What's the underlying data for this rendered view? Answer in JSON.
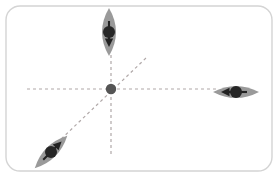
{
  "figure": {
    "canvas": {
      "width": 278,
      "height": 177,
      "background_color": "#ffffff",
      "border_color": "#d4d4d4",
      "border_radius": 14,
      "border_width": 1.4,
      "frame_inset": 6
    },
    "center_point": {
      "label": "origin",
      "x": 111,
      "y": 89,
      "radius": 5.2,
      "color": "#555555"
    },
    "axes": [
      {
        "name": "horizontal-axis",
        "orientation": "horizontal",
        "angle_deg": 0,
        "x1": 27,
        "y1": 89,
        "x2": 216,
        "y2": 89,
        "color": "#b0a8a8",
        "dash": "3 3",
        "width": 1.2
      },
      {
        "name": "vertical-axis",
        "orientation": "vertical",
        "angle_deg": 90,
        "x1": 111,
        "y1": 55,
        "x2": 111,
        "y2": 156,
        "color": "#b0a8a8",
        "dash": "3 3",
        "width": 1.2
      },
      {
        "name": "diagonal-axis",
        "orientation": "diagonal",
        "angle_deg": 45,
        "x1": 57,
        "y1": 143,
        "x2": 146,
        "y2": 58,
        "color": "#b0a8a8",
        "dash": "3 3",
        "width": 1.2
      }
    ],
    "markers": [
      {
        "name": "top-marker",
        "position_label": "top",
        "axis": "vertical-axis",
        "cx": 109,
        "cy": 32,
        "rx": 14,
        "ry": 24,
        "rotation_deg": 0,
        "fill": "#9a9a9a",
        "dot_color": "#262626",
        "dot_radius": 6,
        "arrow_direction": "down",
        "arrow_angle_deg": 90,
        "arrow_color": "#222222",
        "arrow_length": 22
      },
      {
        "name": "right-marker",
        "position_label": "right",
        "axis": "horizontal-axis",
        "cx": 236,
        "cy": 92,
        "rx": 23,
        "ry": 12,
        "rotation_deg": 0,
        "fill": "#9a9a9a",
        "dot_color": "#262626",
        "dot_radius": 6,
        "arrow_direction": "left",
        "arrow_angle_deg": 180,
        "arrow_color": "#222222",
        "arrow_length": 22
      },
      {
        "name": "bottom-left-marker",
        "position_label": "bottom-left",
        "axis": "diagonal-axis",
        "cx": 51,
        "cy": 152,
        "rx": 23,
        "ry": 12,
        "rotation_deg": -45,
        "fill": "#9a9a9a",
        "dot_color": "#262626",
        "dot_radius": 6,
        "arrow_direction": "up-right",
        "arrow_angle_deg": -45,
        "arrow_color": "#222222",
        "arrow_length": 22
      }
    ],
    "colors": {
      "marker_fill": "#9a9a9a",
      "marker_dot": "#262626",
      "axis_dash": "#b0a8a8",
      "origin_dot": "#555555",
      "frame_stroke": "#d4d4d4",
      "background": "#ffffff"
    }
  }
}
